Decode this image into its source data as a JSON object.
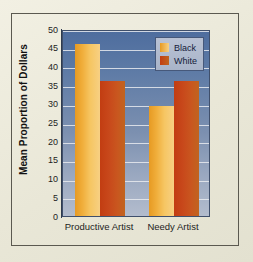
{
  "chart_data": {
    "type": "bar",
    "title": "",
    "xlabel": "",
    "ylabel": "Mean Proportion of Dollars",
    "categories": [
      "Productive Artist",
      "Needy Artist"
    ],
    "series": [
      {
        "name": "Black",
        "values": [
          46,
          29.5
        ],
        "color": "#f0ae3b"
      },
      {
        "name": "White",
        "values": [
          36,
          36
        ],
        "color": "#c8481b"
      }
    ],
    "ylim": [
      0,
      50
    ],
    "yticks": [
      0,
      5,
      10,
      15,
      20,
      25,
      30,
      35,
      40,
      45,
      50
    ],
    "ytick_labels": [
      "0",
      "5",
      "10",
      "15",
      "20",
      "25",
      "30",
      "35",
      "40",
      "45",
      "50"
    ],
    "grid": true,
    "legend_position": "top-right"
  },
  "legend": {
    "entries": [
      {
        "label": "Black"
      },
      {
        "label": "White"
      }
    ]
  },
  "colors": {
    "page_background": "#eceadb",
    "plot_top": "#4e6d9e",
    "plot_bottom": "#b3bccd",
    "gridline": "#e8eaef",
    "axis": "#2f3b4f",
    "black_series": "#f0ae3b",
    "white_series": "#c8481b"
  }
}
